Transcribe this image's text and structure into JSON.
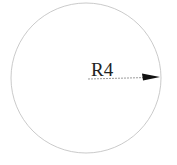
{
  "diagram": {
    "type": "radius-dimension",
    "circle": {
      "cx": 86,
      "cy": 78,
      "r": 75,
      "stroke": "#bdbdbd"
    },
    "dimension": {
      "label": "R4",
      "line_start": [
        88,
        79
      ],
      "line_end": [
        160,
        77
      ],
      "color": "#111111"
    }
  }
}
